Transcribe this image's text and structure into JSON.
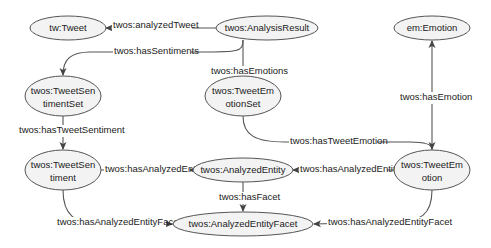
{
  "diagram": {
    "nodes": [
      {
        "id": "tweet",
        "line1": "tw:Tweet",
        "line2": ""
      },
      {
        "id": "analysis_result",
        "line1": "twos:AnalysisResult",
        "line2": ""
      },
      {
        "id": "emotion",
        "line1": "em:Emotion",
        "line2": ""
      },
      {
        "id": "tweet_sentiment_set",
        "line1": "twos:TweetSen",
        "line2": "timentSet"
      },
      {
        "id": "tweet_emotion_set",
        "line1": "twos:TweetEm",
        "line2": "otionSet"
      },
      {
        "id": "tweet_sentiment",
        "line1": "twos:TweetSen",
        "line2": "timent"
      },
      {
        "id": "analyzed_entity",
        "line1": "twos:AnalyzedEntity",
        "line2": ""
      },
      {
        "id": "tweet_emotion",
        "line1": "twos:TweetEm",
        "line2": "otion"
      },
      {
        "id": "analyzed_entity_facet",
        "line1": "twos:AnalyzedEntityFacet",
        "line2": ""
      }
    ],
    "edges": [
      {
        "from": "analysis_result",
        "to": "tweet",
        "label": "twos:analyzedTweet"
      },
      {
        "from": "analysis_result",
        "to": "tweet_sentiment_set",
        "label": "twos:hasSentiments"
      },
      {
        "from": "analysis_result",
        "to": "tweet_emotion_set",
        "label": "twos:hasEmotions"
      },
      {
        "from": "tweet_emotion",
        "to": "emotion",
        "label": "twos:hasEmotion"
      },
      {
        "from": "tweet_sentiment_set",
        "to": "tweet_sentiment",
        "label": "twos:hasTweetSentiment"
      },
      {
        "from": "tweet_emotion_set",
        "to": "tweet_emotion",
        "label": "twos:hasTweetEmotion"
      },
      {
        "from": "tweet_sentiment",
        "to": "analyzed_entity",
        "label": "twos:hasAnalyzedEntity"
      },
      {
        "from": "tweet_emotion",
        "to": "analyzed_entity",
        "label": "twos:hasAnalyzedEntity"
      },
      {
        "from": "analyzed_entity",
        "to": "analyzed_entity_facet",
        "label": "twos:hasFacet"
      },
      {
        "from": "tweet_sentiment",
        "to": "analyzed_entity_facet",
        "label": "twos:hasAnalyzedEntityFacet"
      },
      {
        "from": "tweet_emotion",
        "to": "analyzed_entity_facet",
        "label": "twos:hasAnalyzedEntityFacet"
      }
    ]
  }
}
